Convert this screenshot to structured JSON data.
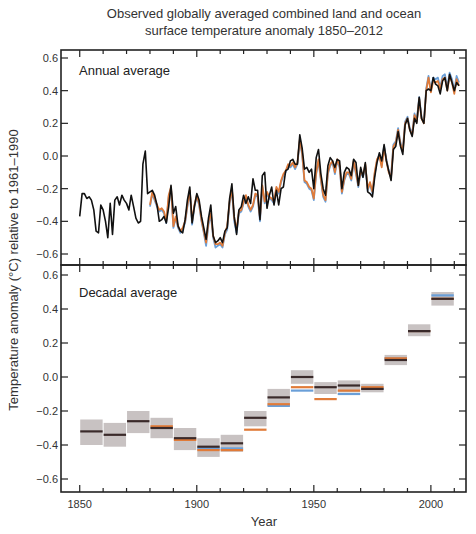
{
  "chart_data": [
    {
      "type": "line",
      "title": "Observed globally averaged combined land and ocean surface temperature anomaly 1850–2012",
      "title_lines": [
        "Observed globally averaged combined land and ocean",
        "surface temperature anomaly 1850–2012"
      ],
      "panel_label": "Annual average",
      "xlabel": "Year",
      "ylabel": "Temperature anomaly (°C) relative to 1961–1990",
      "xlim": [
        1842,
        2015
      ],
      "ylim": [
        -0.68,
        0.62
      ],
      "yticks": [
        0.6,
        0.4,
        0.2,
        0.0,
        -0.2,
        -0.4,
        -0.6
      ],
      "ytick_labels": [
        "0.6",
        "0.4",
        "0.2",
        "0.0",
        "−0.2",
        "−0.4",
        "−0.6"
      ],
      "grid": false,
      "series": [
        {
          "name": "Dataset 1 (black)",
          "color": "#111111",
          "x_start": 1850,
          "values": [
            -0.37,
            -0.23,
            -0.23,
            -0.26,
            -0.25,
            -0.27,
            -0.33,
            -0.46,
            -0.47,
            -0.3,
            -0.33,
            -0.4,
            -0.5,
            -0.29,
            -0.48,
            -0.27,
            -0.25,
            -0.3,
            -0.24,
            -0.27,
            -0.29,
            -0.33,
            -0.24,
            -0.31,
            -0.38,
            -0.41,
            -0.4,
            -0.05,
            0.03,
            -0.23,
            -0.22,
            -0.21,
            -0.24,
            -0.3,
            -0.4,
            -0.39,
            -0.37,
            -0.41,
            -0.31,
            -0.18,
            -0.35,
            -0.31,
            -0.43,
            -0.46,
            -0.47,
            -0.39,
            -0.27,
            -0.19,
            -0.41,
            -0.31,
            -0.23,
            -0.27,
            -0.37,
            -0.44,
            -0.51,
            -0.38,
            -0.3,
            -0.49,
            -0.53,
            -0.52,
            -0.5,
            -0.53,
            -0.46,
            -0.44,
            -0.26,
            -0.17,
            -0.37,
            -0.48,
            -0.33,
            -0.31,
            -0.24,
            -0.29,
            -0.25,
            -0.29,
            -0.14,
            -0.21,
            -0.21,
            -0.39,
            -0.12,
            -0.1,
            -0.32,
            -0.24,
            -0.19,
            -0.3,
            -0.21,
            -0.3,
            -0.2,
            -0.19,
            -0.09,
            -0.08,
            -0.03,
            -0.02,
            -0.05,
            -0.05,
            0.13,
            0.05,
            -0.08,
            -0.07,
            -0.1,
            -0.08,
            -0.2,
            -0.01,
            0.04,
            -0.11,
            -0.2,
            -0.24,
            -0.06,
            -0.01,
            -0.03,
            -0.07,
            -0.02,
            -0.03,
            -0.2,
            -0.1,
            -0.07,
            -0.08,
            -0.12,
            -0.02,
            -0.04,
            -0.18,
            -0.07,
            -0.13,
            -0.04,
            -0.22,
            -0.23,
            -0.25,
            -0.13,
            -0.04,
            0.02,
            -0.03,
            0.07,
            -0.03,
            -0.09,
            -0.15,
            0.04,
            0.06,
            0.15,
            0.06,
            0.01,
            0.19,
            0.23,
            0.16,
            0.12,
            0.23,
            0.2,
            0.36,
            0.23,
            0.2,
            0.4,
            0.41,
            0.4,
            0.48,
            0.44,
            0.43,
            0.38,
            0.46,
            0.48,
            0.4,
            0.5,
            0.45,
            0.4,
            0.45,
            0.43
          ]
        },
        {
          "name": "Dataset 2 (orange)",
          "color": "#e07b39",
          "x_start": 1880,
          "values": [
            -0.3,
            -0.22,
            -0.26,
            -0.3,
            -0.33,
            -0.32,
            -0.34,
            -0.4,
            -0.24,
            -0.19,
            -0.43,
            -0.37,
            -0.43,
            -0.46,
            -0.44,
            -0.4,
            -0.3,
            -0.21,
            -0.4,
            -0.3,
            -0.24,
            -0.29,
            -0.39,
            -0.46,
            -0.53,
            -0.4,
            -0.35,
            -0.49,
            -0.54,
            -0.54,
            -0.53,
            -0.55,
            -0.47,
            -0.43,
            -0.28,
            -0.2,
            -0.38,
            -0.45,
            -0.34,
            -0.33,
            -0.28,
            -0.24,
            -0.3,
            -0.33,
            -0.3,
            -0.23,
            -0.24,
            -0.38,
            -0.18,
            -0.28,
            -0.22,
            -0.25,
            -0.26,
            -0.28,
            -0.19,
            -0.22,
            -0.15,
            -0.11,
            -0.09,
            -0.05,
            -0.06,
            -0.04,
            -0.07,
            -0.04,
            0.1,
            0.02,
            -0.15,
            -0.16,
            -0.19,
            -0.2,
            -0.26,
            -0.1,
            -0.02,
            -0.14,
            -0.24,
            -0.27,
            -0.1,
            -0.05,
            -0.03,
            -0.1,
            -0.02,
            -0.06,
            -0.22,
            -0.14,
            -0.1,
            -0.1,
            -0.14,
            -0.03,
            -0.1,
            -0.18,
            -0.09,
            -0.12,
            -0.05,
            -0.2,
            -0.16,
            -0.22,
            -0.1,
            -0.02,
            0.0,
            -0.07,
            0.05,
            -0.03,
            -0.1,
            -0.13,
            0.06,
            0.08,
            0.16,
            0.07,
            0.03,
            0.2,
            0.23,
            0.16,
            0.13,
            0.25,
            0.21,
            0.35,
            0.23,
            0.2,
            0.4,
            0.48,
            0.39,
            0.46,
            0.45,
            0.46,
            0.41,
            0.47,
            0.48,
            0.4,
            0.49,
            0.45,
            0.38,
            0.47,
            0.43
          ]
        },
        {
          "name": "Dataset 3 (blue)",
          "color": "#6a9fd8",
          "x_start": 1880,
          "values": [
            -0.31,
            -0.23,
            -0.27,
            -0.31,
            -0.34,
            -0.33,
            -0.35,
            -0.41,
            -0.25,
            -0.2,
            -0.44,
            -0.38,
            -0.44,
            -0.47,
            -0.45,
            -0.41,
            -0.31,
            -0.22,
            -0.42,
            -0.31,
            -0.25,
            -0.3,
            -0.4,
            -0.47,
            -0.55,
            -0.42,
            -0.36,
            -0.5,
            -0.56,
            -0.55,
            -0.54,
            -0.56,
            -0.48,
            -0.45,
            -0.29,
            -0.21,
            -0.4,
            -0.47,
            -0.35,
            -0.34,
            -0.29,
            -0.25,
            -0.31,
            -0.34,
            -0.31,
            -0.24,
            -0.25,
            -0.4,
            -0.19,
            -0.29,
            -0.23,
            -0.26,
            -0.27,
            -0.29,
            -0.2,
            -0.23,
            -0.16,
            -0.12,
            -0.1,
            -0.06,
            -0.07,
            -0.05,
            -0.08,
            -0.05,
            0.09,
            0.01,
            -0.16,
            -0.17,
            -0.2,
            -0.21,
            -0.27,
            -0.11,
            -0.03,
            -0.15,
            -0.25,
            -0.28,
            -0.11,
            -0.06,
            -0.04,
            -0.11,
            -0.03,
            -0.07,
            -0.23,
            -0.15,
            -0.11,
            -0.11,
            -0.15,
            -0.04,
            -0.11,
            -0.19,
            -0.1,
            -0.13,
            -0.06,
            -0.21,
            -0.17,
            -0.23,
            -0.11,
            -0.03,
            0.01,
            -0.06,
            0.06,
            -0.02,
            -0.09,
            -0.12,
            0.07,
            0.09,
            0.17,
            0.08,
            0.04,
            0.21,
            0.24,
            0.17,
            0.14,
            0.26,
            0.22,
            0.36,
            0.24,
            0.21,
            0.41,
            0.49,
            0.4,
            0.48,
            0.47,
            0.48,
            0.42,
            0.49,
            0.5,
            0.42,
            0.51,
            0.47,
            0.4,
            0.49,
            0.45
          ]
        }
      ]
    },
    {
      "type": "bar",
      "panel_label": "Decadal average",
      "xlabel": "Year",
      "ylabel": "Temperature anomaly (°C) relative to 1961–1990",
      "xlim": [
        1842,
        2015
      ],
      "ylim": [
        -0.68,
        0.62
      ],
      "xticks": [
        1850,
        1900,
        1950,
        2000
      ],
      "xtick_labels": [
        "1850",
        "1900",
        "1950",
        "2000"
      ],
      "yticks": [
        0.6,
        0.4,
        0.2,
        0.0,
        -0.2,
        -0.4,
        -0.6
      ],
      "ytick_labels": [
        "0.6",
        "0.4",
        "0.2",
        "0.0",
        "−0.2",
        "−0.4",
        "−0.6"
      ],
      "grid": false,
      "uncertainty_color": "#c8c2c2",
      "categories": [
        "1850s",
        "1860s",
        "1870s",
        "1880s",
        "1890s",
        "1900s",
        "1910s",
        "1920s",
        "1930s",
        "1940s",
        "1950s",
        "1960s",
        "1970s",
        "1980s",
        "1990s",
        "2000s"
      ],
      "decade_start": [
        1850,
        1860,
        1870,
        1880,
        1890,
        1900,
        1910,
        1920,
        1930,
        1940,
        1950,
        1960,
        1970,
        1980,
        1990,
        2000
      ],
      "uncertainty_low": [
        -0.4,
        -0.41,
        -0.33,
        -0.36,
        -0.43,
        -0.47,
        -0.44,
        -0.29,
        -0.17,
        -0.04,
        -0.1,
        -0.09,
        -0.09,
        0.07,
        0.24,
        0.42
      ],
      "uncertainty_high": [
        -0.25,
        -0.27,
        -0.2,
        -0.24,
        -0.3,
        -0.36,
        -0.34,
        -0.2,
        -0.07,
        0.04,
        -0.03,
        -0.02,
        -0.04,
        0.13,
        0.31,
        0.5
      ],
      "series": [
        {
          "name": "Dataset 1 (black)",
          "color": "#3a2a2a",
          "values": [
            -0.32,
            -0.34,
            -0.26,
            -0.3,
            -0.36,
            -0.41,
            -0.39,
            -0.24,
            -0.12,
            0.0,
            -0.06,
            -0.05,
            -0.07,
            0.1,
            0.27,
            0.46
          ]
        },
        {
          "name": "Dataset 2 (orange)",
          "color": "#e07b39",
          "values": [
            null,
            null,
            null,
            -0.29,
            -0.37,
            -0.43,
            -0.43,
            -0.31,
            -0.16,
            -0.06,
            -0.13,
            -0.08,
            -0.06,
            0.11,
            0.27,
            0.46
          ]
        },
        {
          "name": "Dataset 3 (blue)",
          "color": "#6a9fd8",
          "values": [
            null,
            null,
            null,
            null,
            null,
            -0.42,
            -0.42,
            null,
            -0.17,
            -0.08,
            null,
            -0.1,
            -0.07,
            0.11,
            0.27,
            0.48
          ]
        }
      ]
    }
  ]
}
